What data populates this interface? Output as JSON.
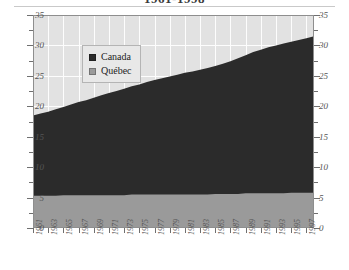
{
  "title": "1961-1998",
  "legend": {
    "position": "inside-top-left",
    "items": [
      {
        "label": "Canada",
        "color": "#2b2b2b",
        "name": "legend-item-canada"
      },
      {
        "label": "Québec",
        "color": "#9a9a9a",
        "name": "legend-item-quebec"
      }
    ]
  },
  "axes": {
    "y_left_ticks": [
      "35",
      "30",
      "25",
      "20",
      "15",
      "10",
      "5",
      "0"
    ],
    "y_right_ticks": [
      "35",
      "30",
      "25",
      "20",
      "15",
      "10",
      "5",
      "0"
    ],
    "x_ticks": [
      "1961",
      "1963",
      "1965",
      "1967",
      "1969",
      "1971",
      "1973",
      "1975",
      "1977",
      "1979",
      "1981",
      "1983",
      "1985",
      "1987",
      "1989",
      "1991",
      "1993",
      "1995",
      "1997"
    ]
  },
  "colors": {
    "canada": "#2b2b2b",
    "quebec": "#9a9a9a",
    "plot_background": "#e2e2e2",
    "gridline": "#fdfdfd",
    "axis": "#8e8e8e"
  },
  "chart_data": {
    "type": "area",
    "stacked": true,
    "title": "1961-1998",
    "xlabel": "",
    "ylabel": "",
    "ylim": [
      0,
      35
    ],
    "yticks": [
      0,
      5,
      10,
      15,
      20,
      25,
      30,
      35
    ],
    "grid": true,
    "legend_position": "inside-top-left",
    "x": [
      1961,
      1962,
      1963,
      1964,
      1965,
      1966,
      1967,
      1968,
      1969,
      1970,
      1971,
      1972,
      1973,
      1974,
      1975,
      1976,
      1977,
      1978,
      1979,
      1980,
      1981,
      1982,
      1983,
      1984,
      1985,
      1986,
      1987,
      1988,
      1989,
      1990,
      1991,
      1992,
      1993,
      1994,
      1995,
      1996,
      1997,
      1998
    ],
    "series": [
      {
        "name": "Canada",
        "color": "#2b2b2b",
        "values": [
          18.5,
          18.8,
          19.1,
          19.5,
          19.9,
          20.3,
          20.7,
          21.0,
          21.4,
          21.8,
          22.2,
          22.5,
          22.9,
          23.3,
          23.6,
          24.0,
          24.3,
          24.6,
          24.9,
          25.2,
          25.5,
          25.7,
          26.0,
          26.3,
          26.6,
          27.0,
          27.4,
          27.9,
          28.4,
          28.9,
          29.3,
          29.7,
          30.0,
          30.3,
          30.6,
          30.9,
          31.2,
          31.5
        ]
      },
      {
        "name": "Québec",
        "color": "#9a9a9a",
        "values": [
          5.3,
          5.3,
          5.3,
          5.3,
          5.4,
          5.4,
          5.4,
          5.4,
          5.4,
          5.4,
          5.4,
          5.4,
          5.4,
          5.5,
          5.5,
          5.5,
          5.5,
          5.5,
          5.5,
          5.5,
          5.5,
          5.5,
          5.5,
          5.5,
          5.6,
          5.6,
          5.6,
          5.6,
          5.7,
          5.7,
          5.7,
          5.7,
          5.7,
          5.7,
          5.8,
          5.8,
          5.8,
          5.8
        ]
      }
    ]
  }
}
